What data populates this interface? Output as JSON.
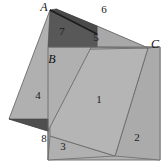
{
  "figure": {
    "background_color": "#ffffff",
    "stroke_color": "#4a4a4a",
    "colors": {
      "light_gray": "#b3b3b3",
      "mid_gray": "#a8a8a8",
      "dark_gray": "#5a5a5a",
      "darker_gray": "#4f4f4f",
      "outline": "#6b6b6b",
      "label_text": "#1a1a1a"
    },
    "vertex_labels": [
      {
        "name": "A",
        "text": "A",
        "x": 44,
        "y": 11
      },
      {
        "name": "B",
        "text": "B",
        "x": 52,
        "y": 63
      },
      {
        "name": "C",
        "text": "C",
        "x": 155,
        "y": 48
      }
    ],
    "region_labels": [
      {
        "name": "region-1",
        "text": "1",
        "x": 99,
        "y": 103
      },
      {
        "name": "region-2",
        "text": "2",
        "x": 137,
        "y": 141
      },
      {
        "name": "region-3",
        "text": "3",
        "x": 63,
        "y": 150
      },
      {
        "name": "region-4",
        "text": "4",
        "x": 38,
        "y": 99
      },
      {
        "name": "region-5",
        "text": "5",
        "x": 96,
        "y": 41
      },
      {
        "name": "region-6",
        "text": "6",
        "x": 104,
        "y": 13
      },
      {
        "name": "region-7",
        "text": "7",
        "x": 62,
        "y": 35
      },
      {
        "name": "region-8",
        "text": "8",
        "x": 44,
        "y": 142
      }
    ],
    "shapes": {
      "outer_square": {
        "name": "large-square-outline",
        "points": "48,47 160,47 160,160 48,160",
        "fill": "#b0b0b0"
      },
      "tilted_square": {
        "name": "tilted-square-region-1",
        "points": "48,50 148,48 115,156 50,136",
        "fill": "#b5b5b5"
      },
      "left_square": {
        "name": "left-tilted-square",
        "points": "50,10 97,36 48,131 9,119",
        "fill": "#b0b0b0"
      },
      "dark_top": {
        "name": "dark-region-7",
        "points": "50,10 97,33 97,47 48,47",
        "fill": "#585858"
      },
      "dark_top_sliver": {
        "name": "dark-region-6-sliver",
        "points": "50,10 97,33 97,26 56,9",
        "fill": "#4a4a4a"
      },
      "dark_bottom": {
        "name": "dark-region-8",
        "points": "9,119 48,131 48,120",
        "fill": "#4f4f4f"
      },
      "region_5": {
        "name": "region-5-shape",
        "points": "97,26 148,48 97,47",
        "fill": "#a8a8a8"
      },
      "region_6": {
        "name": "region-6-shape",
        "points": "56,9 148,48 97,26",
        "fill": "#b8b8b8"
      },
      "region_2": {
        "name": "region-2-shape",
        "points": "148,48 160,47 160,160 115,156",
        "fill": "#ababab"
      },
      "region_3": {
        "name": "region-3-shape",
        "points": "50,136 115,156 48,160",
        "fill": "#b0b0b0"
      }
    }
  }
}
